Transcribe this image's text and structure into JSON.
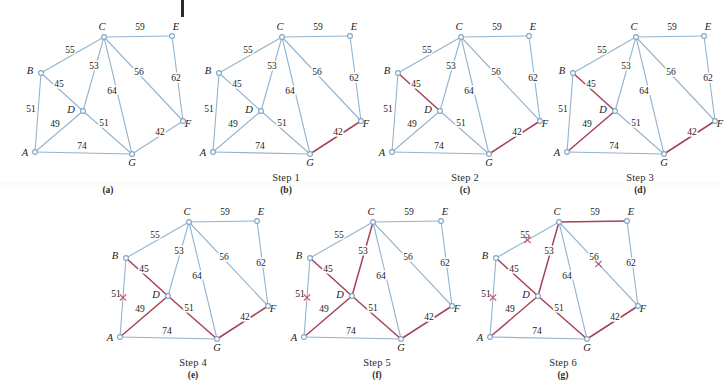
{
  "figure": {
    "title_artifact": "|",
    "node_labels": [
      "A",
      "B",
      "C",
      "D",
      "E",
      "F",
      "G"
    ],
    "colors": {
      "edge_normal": "#93b4cf",
      "edge_selected": "#a8415a",
      "x_mark": "#c0496b",
      "node_stroke": "#7fa5c4",
      "node_fill": "#ffffff",
      "text": "#1b1b1b"
    },
    "nodes": [
      {
        "id": "A",
        "x": 27,
        "y": 144,
        "label": "A",
        "lx": -10,
        "ly": 4
      },
      {
        "id": "B",
        "x": 33,
        "y": 65,
        "label": "B",
        "lx": -11,
        "ly": 1
      },
      {
        "id": "C",
        "x": 96,
        "y": 29,
        "label": "C",
        "lx": -2,
        "ly": -7
      },
      {
        "id": "D",
        "x": 75,
        "y": 103,
        "label": "D",
        "lx": -12,
        "ly": 2
      },
      {
        "id": "E",
        "x": 164,
        "y": 28,
        "label": "E",
        "lx": 4,
        "ly": -6
      },
      {
        "id": "F",
        "x": 175,
        "y": 113,
        "label": "F",
        "lx": 5,
        "ly": 6
      },
      {
        "id": "G",
        "x": 124,
        "y": 146,
        "label": "G",
        "lx": 0,
        "ly": 12
      }
    ],
    "edges": [
      {
        "id": "BC",
        "from": "B",
        "to": "C",
        "weight": "55",
        "lx": 62,
        "ly": 45
      },
      {
        "id": "CE",
        "from": "C",
        "to": "E",
        "weight": "59",
        "lx": 132,
        "ly": 22
      },
      {
        "id": "BD",
        "from": "B",
        "to": "D",
        "weight": "45",
        "lx": 51,
        "ly": 79
      },
      {
        "id": "CD",
        "from": "C",
        "to": "D",
        "weight": "53",
        "lx": 86,
        "ly": 61
      },
      {
        "id": "CG",
        "from": "C",
        "to": "G",
        "weight": "64",
        "lx": 104,
        "ly": 86
      },
      {
        "id": "CF",
        "from": "C",
        "to": "F",
        "weight": "56",
        "lx": 131,
        "ly": 67
      },
      {
        "id": "EF",
        "from": "E",
        "to": "F",
        "weight": "62",
        "lx": 168,
        "ly": 73
      },
      {
        "id": "AB",
        "from": "A",
        "to": "B",
        "weight": "51",
        "lx": 23,
        "ly": 104
      },
      {
        "id": "AD",
        "from": "A",
        "to": "D",
        "weight": "49",
        "lx": 47,
        "ly": 119
      },
      {
        "id": "DG",
        "from": "D",
        "to": "G",
        "weight": "51",
        "lx": 96,
        "ly": 118
      },
      {
        "id": "AG",
        "from": "A",
        "to": "G",
        "weight": "74",
        "lx": 74,
        "ly": 141
      },
      {
        "id": "FG",
        "from": "F",
        "to": "G",
        "weight": "42",
        "lx": 152,
        "ly": 127
      }
    ],
    "panels": [
      {
        "key": "a",
        "left": 8,
        "top": 8,
        "step": "",
        "letter": "(a)",
        "selected": [],
        "rejected": []
      },
      {
        "key": "b",
        "left": 186,
        "top": 8,
        "step": "Step 1",
        "letter": "(b)",
        "selected": [
          "FG"
        ],
        "rejected": []
      },
      {
        "key": "c",
        "left": 365,
        "top": 8,
        "step": "Step 2",
        "letter": "(c)",
        "selected": [
          "FG",
          "BD"
        ],
        "rejected": []
      },
      {
        "key": "d",
        "left": 540,
        "top": 8,
        "step": "Step 3",
        "letter": "(d)",
        "selected": [
          "FG",
          "BD",
          "AD"
        ],
        "rejected": []
      },
      {
        "key": "e",
        "left": 93,
        "top": 193,
        "step": "Step 4",
        "letter": "(e)",
        "selected": [
          "FG",
          "BD",
          "AD",
          "DG"
        ],
        "rejected": [
          "AB"
        ]
      },
      {
        "key": "f",
        "left": 277,
        "top": 193,
        "step": "Step 5",
        "letter": "(f)",
        "selected": [
          "FG",
          "BD",
          "AD",
          "DG",
          "CD"
        ],
        "rejected": [
          "AB"
        ]
      },
      {
        "key": "g",
        "left": 463,
        "top": 193,
        "step": "Step 6",
        "letter": "(g)",
        "selected": [
          "FG",
          "BD",
          "AD",
          "DG",
          "CD",
          "CE"
        ],
        "rejected": [
          "AB",
          "BC",
          "CF"
        ]
      }
    ]
  }
}
